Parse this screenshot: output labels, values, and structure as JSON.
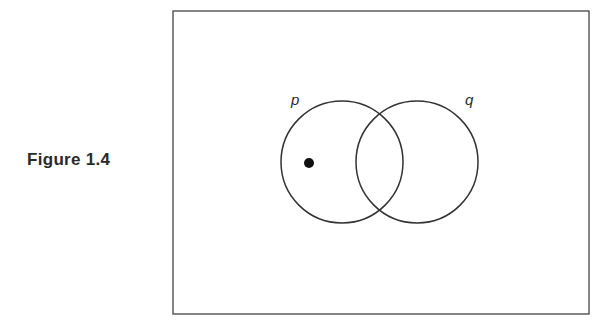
{
  "caption": "Figure 1.4",
  "diagram": {
    "type": "venn",
    "universe_rect": {
      "x": 173,
      "y": 11,
      "width": 416,
      "height": 303
    },
    "sets": [
      {
        "label": "p",
        "cx": 342,
        "cy": 162,
        "r": 61
      },
      {
        "label": "q",
        "cx": 417,
        "cy": 162,
        "r": 61
      }
    ],
    "points": [
      {
        "cx": 309,
        "cy": 163,
        "r": 5,
        "region": "p only"
      }
    ],
    "stroke_color": "#333333"
  }
}
